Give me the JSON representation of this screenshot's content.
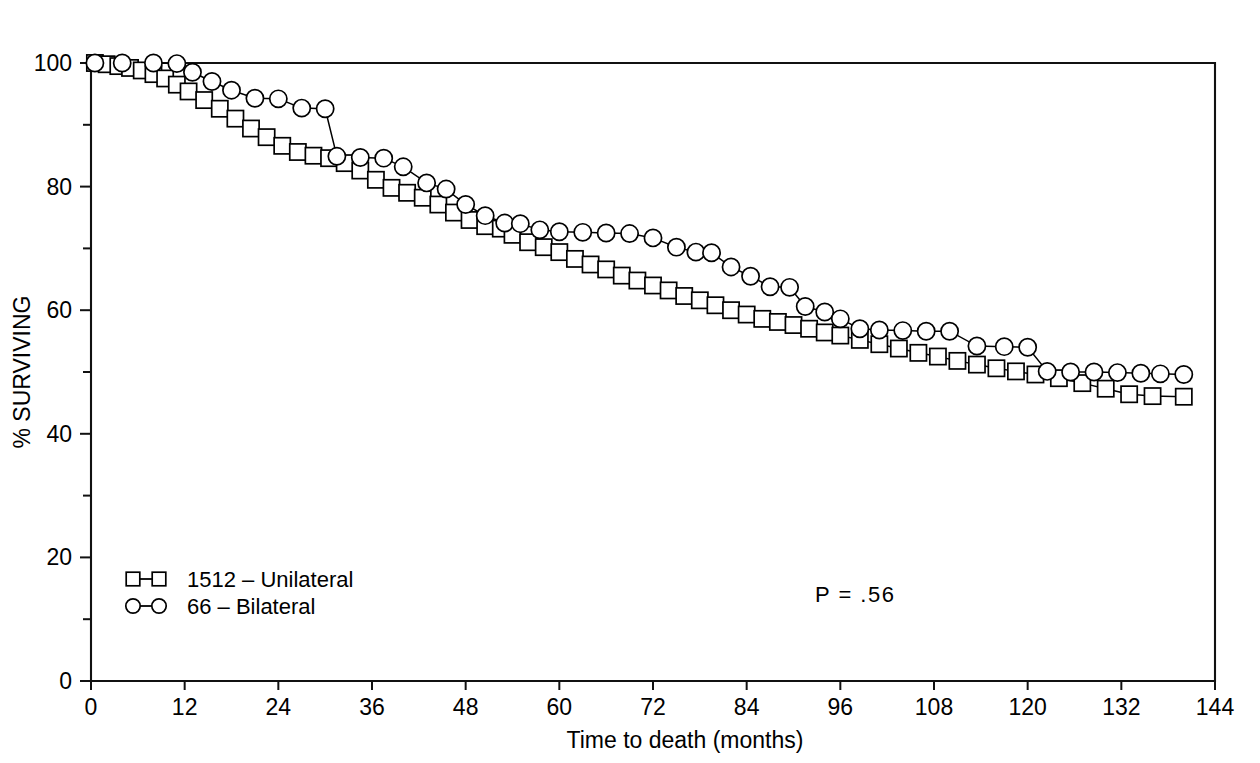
{
  "chart_data": {
    "type": "line",
    "title": "",
    "xlabel": "Time to death (months)",
    "ylabel": "% SURVIVING",
    "xlim": [
      0,
      144
    ],
    "ylim": [
      0,
      100
    ],
    "xticks": [
      0,
      12,
      24,
      36,
      48,
      60,
      72,
      84,
      96,
      108,
      120,
      132,
      144
    ],
    "xtick_labels": [
      "0",
      "12",
      "24",
      "36",
      "48",
      "60",
      "72",
      "84",
      "96",
      "108",
      "120",
      "132",
      "144"
    ],
    "yticks": [
      0,
      20,
      40,
      60,
      80,
      100
    ],
    "ytick_labels": [
      "0",
      "20",
      "40",
      "60",
      "80",
      "100"
    ],
    "yticks_minor": [
      10,
      30,
      50,
      70,
      90
    ],
    "grid": false,
    "legend_position": "lower-left",
    "annotations": [
      {
        "text": "P  =  .56",
        "x": 85,
        "y": 14
      }
    ],
    "series": [
      {
        "name": "1512 – Unilateral",
        "marker": "square",
        "points": [
          [
            0.5,
            100.0
          ],
          [
            2.0,
            99.8
          ],
          [
            3.5,
            99.5
          ],
          [
            5.0,
            99.2
          ],
          [
            6.5,
            98.8
          ],
          [
            8.0,
            98.2
          ],
          [
            9.5,
            97.5
          ],
          [
            11.0,
            96.5
          ],
          [
            12.5,
            95.4
          ],
          [
            14.5,
            94.0
          ],
          [
            16.5,
            92.6
          ],
          [
            18.5,
            91.0
          ],
          [
            20.5,
            89.4
          ],
          [
            22.5,
            88.0
          ],
          [
            24.5,
            86.6
          ],
          [
            26.5,
            85.6
          ],
          [
            28.5,
            85.0
          ],
          [
            30.5,
            84.6
          ],
          [
            32.5,
            83.8
          ],
          [
            34.5,
            82.6
          ],
          [
            36.5,
            81.1
          ],
          [
            38.5,
            79.8
          ],
          [
            40.5,
            79.0
          ],
          [
            42.5,
            78.2
          ],
          [
            44.5,
            77.1
          ],
          [
            46.5,
            75.8
          ],
          [
            48.5,
            74.6
          ],
          [
            50.5,
            73.6
          ],
          [
            52.5,
            73.2
          ],
          [
            54.0,
            72.2
          ],
          [
            56.0,
            71.0
          ],
          [
            58.0,
            70.2
          ],
          [
            60.0,
            69.4
          ],
          [
            62.0,
            68.3
          ],
          [
            64.0,
            67.4
          ],
          [
            66.0,
            66.6
          ],
          [
            68.0,
            65.6
          ],
          [
            70.0,
            64.8
          ],
          [
            72.0,
            64.0
          ],
          [
            74.0,
            63.2
          ],
          [
            76.0,
            62.3
          ],
          [
            78.0,
            61.6
          ],
          [
            80.0,
            60.8
          ],
          [
            82.0,
            60.0
          ],
          [
            84.0,
            59.3
          ],
          [
            86.0,
            58.6
          ],
          [
            88.0,
            58.1
          ],
          [
            90.0,
            57.6
          ],
          [
            92.0,
            57.0
          ],
          [
            94.0,
            56.4
          ],
          [
            96.0,
            55.9
          ],
          [
            98.5,
            55.2
          ],
          [
            101.0,
            54.5
          ],
          [
            103.5,
            53.8
          ],
          [
            106.0,
            53.1
          ],
          [
            108.5,
            52.5
          ],
          [
            111.0,
            51.8
          ],
          [
            113.5,
            51.2
          ],
          [
            116.0,
            50.6
          ],
          [
            118.5,
            50.1
          ],
          [
            121.0,
            49.6
          ],
          [
            124.0,
            49.0
          ],
          [
            127.0,
            48.2
          ],
          [
            130.0,
            47.3
          ],
          [
            133.0,
            46.4
          ],
          [
            136.0,
            46.1
          ],
          [
            140.0,
            46.0
          ]
        ]
      },
      {
        "name": "66 – Bilateral",
        "marker": "circle",
        "points": [
          [
            0.5,
            100.0
          ],
          [
            4.0,
            100.0
          ],
          [
            8.0,
            100.0
          ],
          [
            11.0,
            99.9
          ],
          [
            13.0,
            98.5
          ],
          [
            15.5,
            97.0
          ],
          [
            18.0,
            95.6
          ],
          [
            21.0,
            94.3
          ],
          [
            24.0,
            94.2
          ],
          [
            27.0,
            92.7
          ],
          [
            30.0,
            92.6
          ],
          [
            31.5,
            84.9
          ],
          [
            34.5,
            84.7
          ],
          [
            37.5,
            84.6
          ],
          [
            40.0,
            83.2
          ],
          [
            43.0,
            80.6
          ],
          [
            45.5,
            79.6
          ],
          [
            48.0,
            77.1
          ],
          [
            50.5,
            75.3
          ],
          [
            53.0,
            74.1
          ],
          [
            55.0,
            74.0
          ],
          [
            57.5,
            73.0
          ],
          [
            60.0,
            72.7
          ],
          [
            63.0,
            72.6
          ],
          [
            66.0,
            72.5
          ],
          [
            69.0,
            72.4
          ],
          [
            72.0,
            71.7
          ],
          [
            75.0,
            70.2
          ],
          [
            77.5,
            69.4
          ],
          [
            79.5,
            69.3
          ],
          [
            82.0,
            67.0
          ],
          [
            84.5,
            65.5
          ],
          [
            87.0,
            63.8
          ],
          [
            89.5,
            63.7
          ],
          [
            91.5,
            60.6
          ],
          [
            94.0,
            59.7
          ],
          [
            96.0,
            58.6
          ],
          [
            98.5,
            57.0
          ],
          [
            101.0,
            56.8
          ],
          [
            104.0,
            56.7
          ],
          [
            107.0,
            56.6
          ],
          [
            110.0,
            56.6
          ],
          [
            113.5,
            54.2
          ],
          [
            117.0,
            54.1
          ],
          [
            120.0,
            54.0
          ],
          [
            122.5,
            50.1
          ],
          [
            125.5,
            50.0
          ],
          [
            128.5,
            50.0
          ],
          [
            131.5,
            49.9
          ],
          [
            134.5,
            49.8
          ],
          [
            137.0,
            49.7
          ],
          [
            140.0,
            49.6
          ]
        ]
      }
    ]
  },
  "legend": {
    "items": [
      {
        "label": "1512 – Unilateral",
        "marker": "square"
      },
      {
        "label": "66 – Bilateral",
        "marker": "circle"
      }
    ]
  },
  "annotation": {
    "pvalue": "P  =  .56"
  },
  "axes": {
    "x_title": "Time to death (months)",
    "y_title": "% SURVIVING"
  }
}
